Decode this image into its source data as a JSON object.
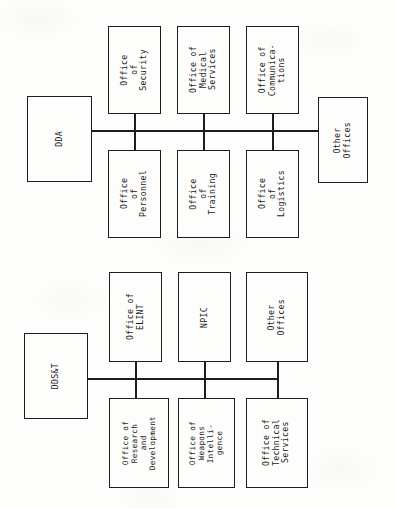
{
  "document": {
    "type": "organizational-chart",
    "orientation": "rotated-90-ccw",
    "charts": [
      {
        "id": "dda",
        "root": {
          "label": "DDA"
        },
        "terminal": {
          "label": "Other\nOffices"
        },
        "top_row": [
          {
            "label": "Office\nof\nSecurity"
          },
          {
            "label": "Office of\nMedical\nServices"
          },
          {
            "label": "Office of\nCommunica-\ntions"
          }
        ],
        "bottom_row": [
          {
            "label": "Office\nof\nPersonnel"
          },
          {
            "label": "Office\nof\nTraining"
          },
          {
            "label": "Office\nof\nLogistics"
          }
        ]
      },
      {
        "id": "ddst",
        "root": {
          "label": "DDS&T"
        },
        "top_row": [
          {
            "label": "Office of\nELINT"
          },
          {
            "label": "NPIC"
          },
          {
            "label": "Other\nOffices"
          }
        ],
        "bottom_row": [
          {
            "label": "Office of\nResearch\nand\nDevelopment"
          },
          {
            "label": "Office of\nWeapons\nIntelli-\ngence"
          },
          {
            "label": "Office of\nTechnical\nServices"
          }
        ]
      }
    ]
  },
  "colors": {
    "line": "#1d1d1d",
    "paper": "#fdfdfb",
    "text": "#1a1a1a"
  }
}
